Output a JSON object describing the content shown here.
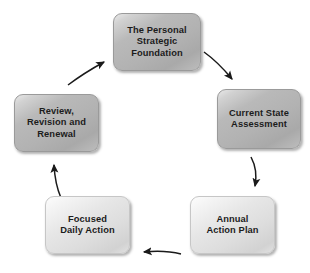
{
  "diagram": {
    "type": "cycle",
    "direction": "clockwise",
    "background_color": "#ffffff",
    "text_color": "#1c1c1c",
    "arrow_color": "#1a1a1a",
    "nodes": [
      {
        "id": "personal-strategic-foundation",
        "label": "The Personal\nStrategic\nFoundation",
        "position": "top",
        "tone": "dark",
        "fill_color": "#b2b2b2"
      },
      {
        "id": "current-state-assessment",
        "label": "Current State\nAssessment",
        "position": "right",
        "tone": "dark",
        "fill_color": "#b2b2b2"
      },
      {
        "id": "annual-action-plan",
        "label": "Annual\nAction Plan",
        "position": "bottom-right",
        "tone": "light",
        "fill_color": "#e2e2e2"
      },
      {
        "id": "focused-daily-action",
        "label": "Focused\nDaily Action",
        "position": "bottom-left",
        "tone": "light",
        "fill_color": "#e2e2e2"
      },
      {
        "id": "review-revision-renewal",
        "label": "Review,\nRevision and\nRenewal",
        "position": "left",
        "tone": "dark",
        "fill_color": "#b2b2b2"
      }
    ],
    "arrows": [
      {
        "id": "foundation-to-assessment",
        "from": "personal-strategic-foundation",
        "to": "current-state-assessment"
      },
      {
        "id": "assessment-to-plan",
        "from": "current-state-assessment",
        "to": "annual-action-plan"
      },
      {
        "id": "plan-to-daily-action",
        "from": "annual-action-plan",
        "to": "focused-daily-action"
      },
      {
        "id": "daily-action-to-review",
        "from": "focused-daily-action",
        "to": "review-revision-renewal"
      },
      {
        "id": "review-to-foundation",
        "from": "review-revision-renewal",
        "to": "personal-strategic-foundation"
      }
    ]
  }
}
